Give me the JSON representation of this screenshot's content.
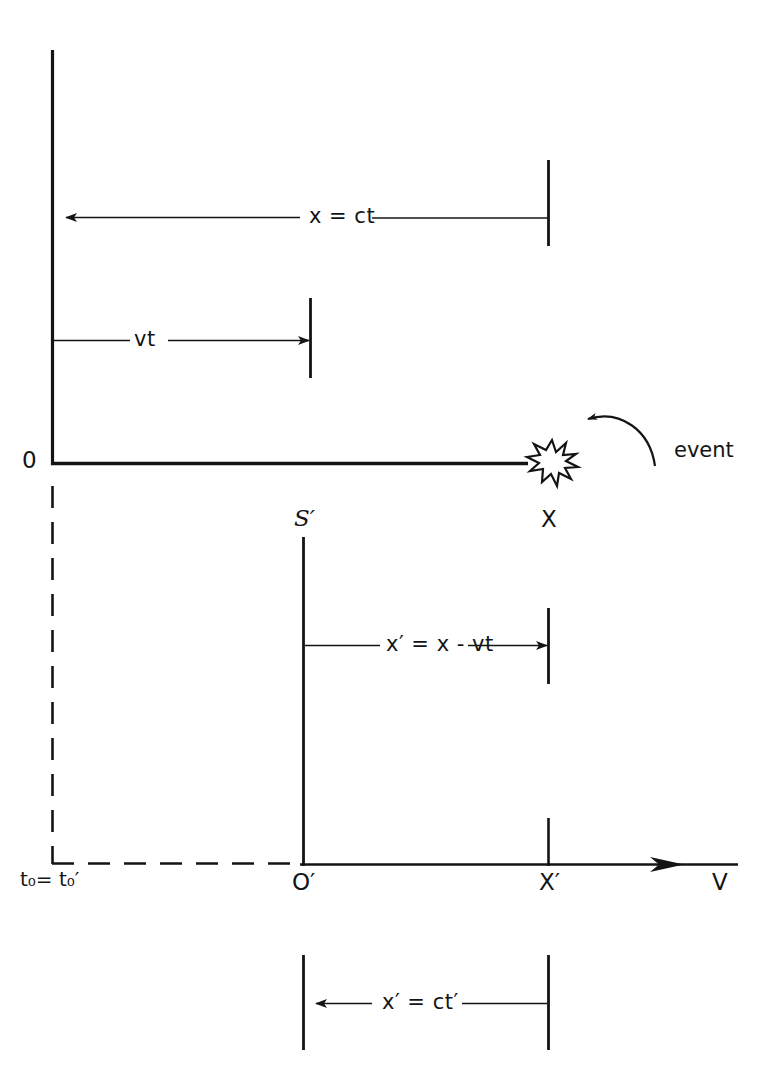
{
  "figure": {
    "kind": "physics-reference-frame-diagram"
  },
  "labels": {
    "origin_S": "0",
    "origin_S_prime": "O′",
    "frame_S_prime": "S′",
    "position_X": "X",
    "position_X_prime": "X′",
    "velocity_axis": "V",
    "time_equality": "t₀= t₀′",
    "event": "event",
    "eq_x_ct": "x = ct",
    "eq_vt": "vt",
    "eq_xprime_x_minus_vt": "x′ = x - vt",
    "eq_xprime_ctprime": "x′ = ct′"
  },
  "colors": {
    "ink": "#141414",
    "background": "#ffffff"
  },
  "icons": {
    "event_burst": "starburst-icon",
    "event_pointer": "curved-arrow-icon",
    "axis_arrow": "arrowhead-icon"
  },
  "geometry": {
    "frame_S": {
      "vertical_axis_x": 52,
      "vertical_axis_top_y": 50,
      "horizontal_axis_y": 464,
      "horizontal_axis_end_x": 528
    },
    "frame_S_prime": {
      "vertical_axis_x": 303,
      "vertical_axis_top_y": 537,
      "horizontal_axis_y": 865,
      "horizontal_axis_end_x": 740
    },
    "measure_x_ct": {
      "y": 217,
      "from_x": 52,
      "to_x": 548
    },
    "measure_vt": {
      "y": 340,
      "from_x": 52,
      "to_x": 310
    },
    "measure_xprime": {
      "y": 645,
      "from_x": 303,
      "to_x": 548
    },
    "measure_xprime_ctprime": {
      "y": 1003,
      "from_x": 303,
      "to_x": 548
    },
    "event_position": {
      "x": 552,
      "y": 463
    },
    "dashed_vertical_x": 52,
    "dashed_horizontal_y": 863
  }
}
